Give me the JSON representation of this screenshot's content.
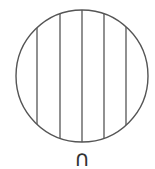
{
  "figure": {
    "shape": "circle",
    "center": [
      82,
      76
    ],
    "radius": 66,
    "stroke_color": "#555555",
    "fill_color": "#ffffff",
    "line_count": 5,
    "vertical_lines_x": [
      37,
      60,
      82,
      104,
      126
    ],
    "line_color": "#555555"
  },
  "label": {
    "text": "∩"
  }
}
